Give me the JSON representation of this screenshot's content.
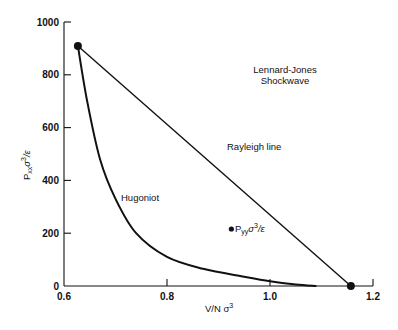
{
  "chart_data": {
    "type": "line",
    "title": "Lennard-Jones Shockwave",
    "title_lines": [
      "Lennard-Jones",
      "Shockwave"
    ],
    "xlabel": "V/N σ³",
    "ylabel": "Pxx σ³/ε",
    "xlim": [
      0.6,
      1.2
    ],
    "ylim": [
      0,
      1000
    ],
    "xticks": [
      0.6,
      0.8,
      1.0,
      1.2
    ],
    "xtick_labels": [
      "0.6",
      "0.8",
      "1.0",
      "1.2"
    ],
    "yticks": [
      0,
      200,
      400,
      600,
      800,
      1000
    ],
    "ytick_labels": [
      "0",
      "200",
      "400",
      "600",
      "800",
      "1000"
    ],
    "grid": false,
    "series": [
      {
        "name": "Hugoniot",
        "label": "Hugoniot",
        "x": [
          0.627,
          0.645,
          0.67,
          0.7,
          0.74,
          0.8,
          0.87,
          0.95,
          1.0,
          1.05,
          1.09
        ],
        "y": [
          909,
          700,
          480,
          330,
          200,
          110,
          65,
          35,
          18,
          6,
          0
        ]
      },
      {
        "name": "Rayleigh line",
        "label": "Rayleigh line",
        "x": [
          0.627,
          1.157
        ],
        "y": [
          909,
          0
        ]
      }
    ],
    "points": [
      {
        "name": "shocked-state",
        "x": 0.627,
        "y": 909
      },
      {
        "name": "initial-state",
        "x": 1.157,
        "y": 0
      },
      {
        "name": "Pyy",
        "label": "Pyy σ³/ε",
        "x": 0.925,
        "y": 216
      }
    ],
    "annotations": [
      {
        "text": "Lennard-Jones Shockwave",
        "x": 1.03,
        "y": 770
      },
      {
        "text": "Rayleigh line",
        "x": 0.96,
        "y": 620
      },
      {
        "text": "Hugoniot",
        "x": 0.72,
        "y": 375
      },
      {
        "text": "Pyy σ³/ε",
        "x": 0.93,
        "y": 216
      }
    ]
  },
  "labels": {
    "title_line1": "Lennard-Jones",
    "title_line2": "Shockwave",
    "rayleigh": "Rayleigh line",
    "hugoniot": "Hugoniot",
    "pyy_main": "P",
    "pyy_sub": "yy",
    "pyy_rest": "σ",
    "pyy_sup": "3",
    "pyy_tail": "/ε",
    "xlabel_main": "V/N σ",
    "xlabel_sup": "3",
    "ylabel_main": "P",
    "ylabel_sub": "xx",
    "ylabel_sigma": "σ",
    "ylabel_sup": "3",
    "ylabel_tail": "/ε"
  }
}
